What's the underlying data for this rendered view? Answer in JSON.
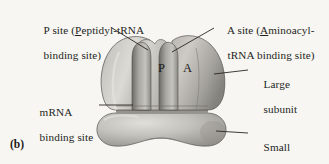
{
  "figure": {
    "panel_letter": "(b)",
    "background_color": "#f7f6f2",
    "ink_color": "#241f1c"
  },
  "labels": {
    "p_site": {
      "line1_pre": "P site (",
      "line1_underlined": "P",
      "line1_post": "eptidyl-tRNA",
      "line2": "binding site)"
    },
    "a_site": {
      "line1_pre": "A site (",
      "line1_underlined": "A",
      "line1_post": "minoacyl-",
      "line2": "tRNA binding site)"
    },
    "mrna": {
      "line1": "mRNA",
      "line2": "binding site"
    },
    "large_subunit": {
      "line1": "Large",
      "line2": "subunit"
    },
    "small_subunit": {
      "line1": "Small",
      "line2": "subunit"
    }
  },
  "site_letters": {
    "p": "P",
    "a": "A"
  },
  "art_colors": {
    "large_subunit_light": "#d9d7d2",
    "large_subunit_mid": "#b6b4ae",
    "large_subunit_dark": "#8d8b86",
    "small_subunit_light": "#d5d3ce",
    "small_subunit_mid": "#b2b0aa",
    "small_subunit_dark": "#8a8883",
    "groove_shadow": "#6f6d69",
    "outline": "#4a4845",
    "leader_line": "#2a2724"
  }
}
